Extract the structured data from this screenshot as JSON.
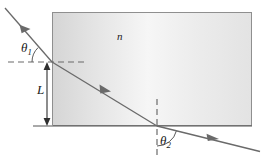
{
  "figure": {
    "background_color": "#ffffff",
    "line_color": "#4a4a4a",
    "label_color": "#1a1a1a"
  },
  "labels": {
    "theta1": "θ",
    "theta1_sub": "1",
    "theta2": "θ",
    "theta2_sub": "2",
    "refractive_index": "n",
    "length": "L"
  },
  "slab": {
    "name": "transparent-medium",
    "fill_left": "#d8d8d8",
    "fill_mid": "#f4f4f4",
    "fill_right": "#e4e4e4",
    "border_color": "#8a8a8a",
    "x": 52,
    "y": 12,
    "width": 200,
    "height": 114
  },
  "geometry": {
    "incident_ray": {
      "x1": 5,
      "y1": 8,
      "x2": 52,
      "y2": 62
    },
    "internal_ray": {
      "x1": 52,
      "y1": 62,
      "x2": 157,
      "y2": 126
    },
    "exit_ray": {
      "x1": 157,
      "y1": 126,
      "x2": 258,
      "y2": 151
    },
    "horizontal_normal": {
      "x1": 8,
      "y1": 62,
      "x2": 84,
      "y2": 62
    },
    "vertical_normal": {
      "x1": 157,
      "y1": 99,
      "x2": 157,
      "y2": 154
    },
    "baseline": {
      "x1": 33,
      "y1": 126,
      "x2": 252,
      "y2": 126
    },
    "left_edge_extension": {
      "x1": 52,
      "y1": 62,
      "x2": 52,
      "y2": 126
    },
    "dimension_arrow_L": {
      "x": 47,
      "y_top": 64,
      "y_bottom": 124
    },
    "angle_arc_theta1": {
      "cx": 52,
      "cy": 62,
      "r": 22
    },
    "angle_arc_theta2": {
      "cx": 157,
      "cy": 126,
      "r": 20
    }
  }
}
